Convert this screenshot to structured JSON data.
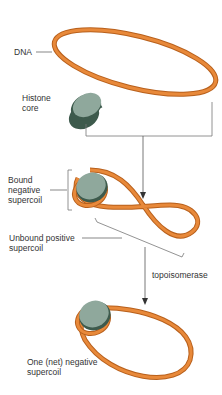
{
  "labels": {
    "dna": "DNA",
    "histone_core": "Histone\ncore",
    "bound_negative": "Bound\nnegative\nsupercoil",
    "unbound_positive": "Unbound positive\nsupercoil",
    "topoisomerase": "topoisomerase",
    "one_net_negative": "One (net) negative\nsupercoil"
  },
  "colors": {
    "dna_fill": "#e8893a",
    "dna_edge": "#b8601c",
    "histone_top": "#8fa89c",
    "histone_side": "#3d5a4c",
    "line": "#555555"
  }
}
